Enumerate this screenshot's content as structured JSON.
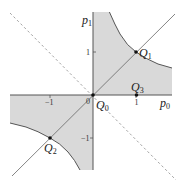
{
  "diagram": {
    "axes": {
      "x_label": "p",
      "x_sub": "0",
      "y_label": "p",
      "y_sub": "1"
    },
    "ticks": {
      "x_pos": "1",
      "x_neg": "−1",
      "y_pos": "1",
      "y_neg": "−1",
      "origin": "0"
    },
    "points": [
      {
        "label": "Q",
        "sub": "0",
        "x": 0,
        "y": 0
      },
      {
        "label": "Q",
        "sub": "1",
        "x": 1,
        "y": 1
      },
      {
        "label": "Q",
        "sub": "2",
        "x": -1,
        "y": -1
      },
      {
        "label": "Q",
        "sub": "3",
        "x": 1,
        "y": 0
      }
    ],
    "curves": {
      "hyperbola": "p0 * p1 = 1",
      "solid_line": "p1 = p0",
      "dashed_line": "p1 = -p0"
    },
    "colors": {
      "shade": "#d9d9d9",
      "axis": "#555555",
      "curve": "#555555",
      "dashed": "#999999",
      "point": "#111111"
    }
  }
}
